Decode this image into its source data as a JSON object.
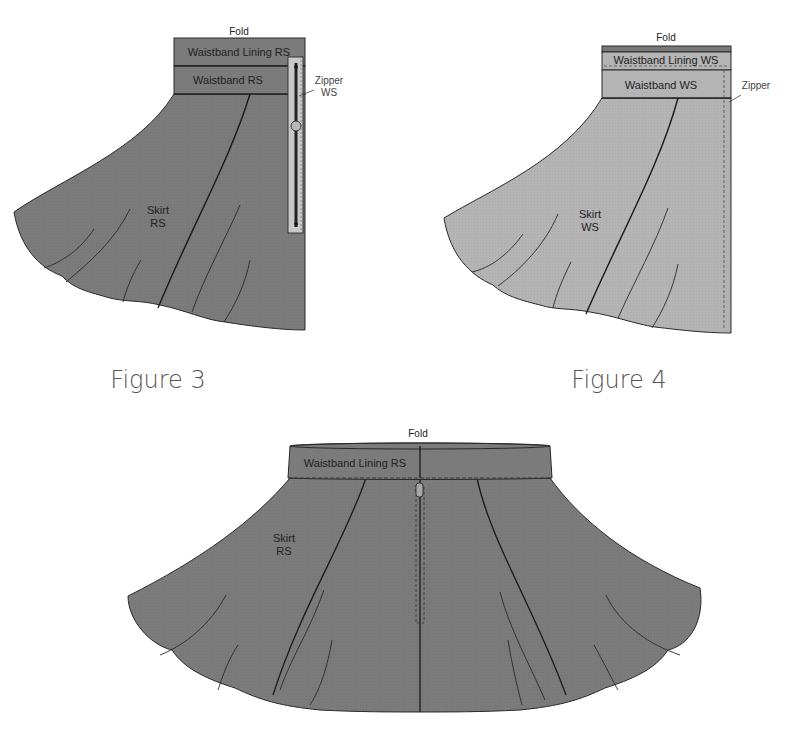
{
  "colors": {
    "fabric_rs": "#7b7b7b",
    "fabric_ws": "#b4b4b4",
    "outline": "#2a2a2a",
    "zipper_tape": "#c8c8c8",
    "zipper_teeth": "#222222",
    "background": "#ffffff"
  },
  "figure3": {
    "caption": "Figure 3",
    "fold_label": "Fold",
    "waistband_lining_label": "Waistband Lining RS",
    "waistband_label": "Waistband RS",
    "zipper_label_line1": "Zipper",
    "zipper_label_line2": "WS",
    "skirt_label_line1": "Skirt",
    "skirt_label_line2": "RS"
  },
  "figure4": {
    "caption": "Figure 4",
    "fold_label": "Fold",
    "waistband_lining_label": "Waistband Lining WS",
    "waistband_label": "Waistband WS",
    "zipper_label": "Zipper",
    "skirt_label_line1": "Skirt",
    "skirt_label_line2": "WS"
  },
  "figure5": {
    "fold_label": "Fold",
    "waistband_lining_label": "Waistband Lining RS",
    "skirt_label_line1": "Skirt",
    "skirt_label_line2": "RS"
  }
}
